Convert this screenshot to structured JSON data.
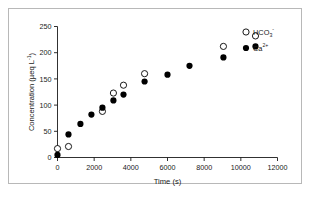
{
  "chart_data": {
    "type": "scatter",
    "title": "",
    "xlabel": "Time (s)",
    "ylabel": "Concentration (µeq L⁻¹)",
    "ylabel_parts": {
      "main": "Concentration (µeq L",
      "sup": "-1",
      "tail": ")"
    },
    "xlim": [
      0,
      12000
    ],
    "ylim": [
      0,
      250
    ],
    "xticks": [
      0,
      2000,
      4000,
      6000,
      8000,
      10000,
      12000
    ],
    "yticks": [
      0,
      50,
      100,
      150,
      200,
      250
    ],
    "xtick_labels": [
      "0",
      "2000",
      "4000",
      "6000",
      "8000",
      "10000",
      "12000"
    ],
    "ytick_labels": [
      "0",
      "50",
      "100",
      "150",
      "200",
      "250"
    ],
    "grid": false,
    "legend_position": "top-right-inside",
    "series": [
      {
        "name": "HCO3-",
        "label_main": "HCO",
        "label_sub": "3",
        "label_sup": "-",
        "marker": "open-circle",
        "color": "#000000",
        "points": [
          {
            "x": 0,
            "y": 17
          },
          {
            "x": 600,
            "y": 21
          },
          {
            "x": 2450,
            "y": 88
          },
          {
            "x": 3050,
            "y": 123
          },
          {
            "x": 3600,
            "y": 138
          },
          {
            "x": 4750,
            "y": 160
          },
          {
            "x": 9050,
            "y": 212
          },
          {
            "x": 10800,
            "y": 232
          }
        ]
      },
      {
        "name": "Ca2+",
        "label_main": "Ca",
        "label_sub": "",
        "label_sup": "2+",
        "marker": "filled-circle",
        "color": "#000000",
        "points": [
          {
            "x": 0,
            "y": 5
          },
          {
            "x": 600,
            "y": 44
          },
          {
            "x": 1250,
            "y": 64
          },
          {
            "x": 1850,
            "y": 82
          },
          {
            "x": 2450,
            "y": 95
          },
          {
            "x": 3050,
            "y": 109
          },
          {
            "x": 3600,
            "y": 120
          },
          {
            "x": 4750,
            "y": 145
          },
          {
            "x": 6000,
            "y": 158
          },
          {
            "x": 7200,
            "y": 175
          },
          {
            "x": 9050,
            "y": 191
          },
          {
            "x": 10800,
            "y": 212
          }
        ]
      }
    ]
  },
  "figure": {
    "border_color": "#b8b8b8",
    "background": "#ffffff",
    "axis_color": "#1a1a1a"
  }
}
